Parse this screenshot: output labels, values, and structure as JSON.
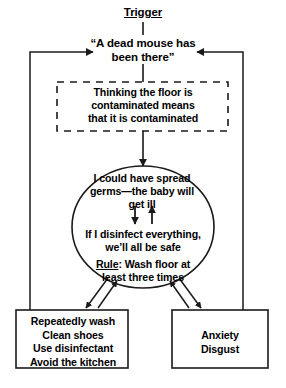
{
  "diagram": {
    "title": "Trigger",
    "nodes": {
      "trigger": {
        "label": "Trigger",
        "shape": "plain-underlined-heading"
      },
      "situation": {
        "label": "“A dead mouse has\nbeen there”",
        "shape": "plain-text"
      },
      "assumption": {
        "label": "Thinking the floor is\ncontaminated means\nthat it is contaminated",
        "shape": "dashed-rectangle"
      },
      "appraisal_line_1": {
        "label": "I could have spread\ngerms—the baby will\nget ill"
      },
      "appraisal_line_2": {
        "label": "If I disinfect everything,\nwe’ll all be safe"
      },
      "appraisal_rule": {
        "rule_label": "Rule",
        "label": ": Wash floor at\nleast three times"
      },
      "behaviour": {
        "label": "Repeatedly wash\nClean shoes\nUse disinfectant\nAvoid the kitchen",
        "shape": "rectangle"
      },
      "emotion": {
        "label": "Anxiety\nDisgust",
        "shape": "rectangle"
      }
    },
    "colors": {
      "stroke": "#1a1a1a",
      "text": "#000000",
      "background": "#ffffff"
    }
  }
}
